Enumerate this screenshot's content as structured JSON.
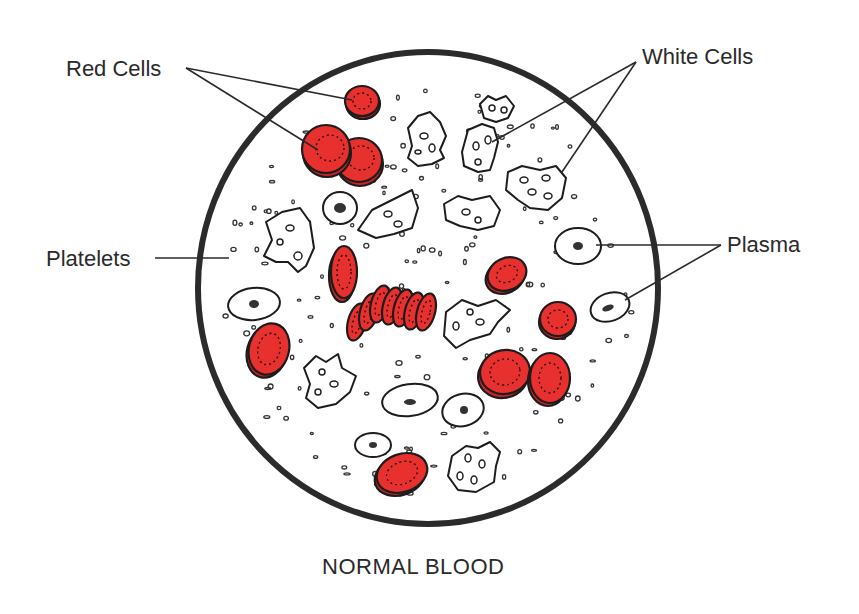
{
  "figure": {
    "caption": "NORMAL BLOOD",
    "colors": {
      "red_cell_fill": "#e8312f",
      "outline": "#1c1c1c",
      "label_text": "#2a2a2a",
      "background": "#ffffff"
    }
  },
  "labels": {
    "red_cells": "Red Cells",
    "white_cells": "White Cells",
    "platelets": "Platelets",
    "plasma": "Plasma"
  }
}
